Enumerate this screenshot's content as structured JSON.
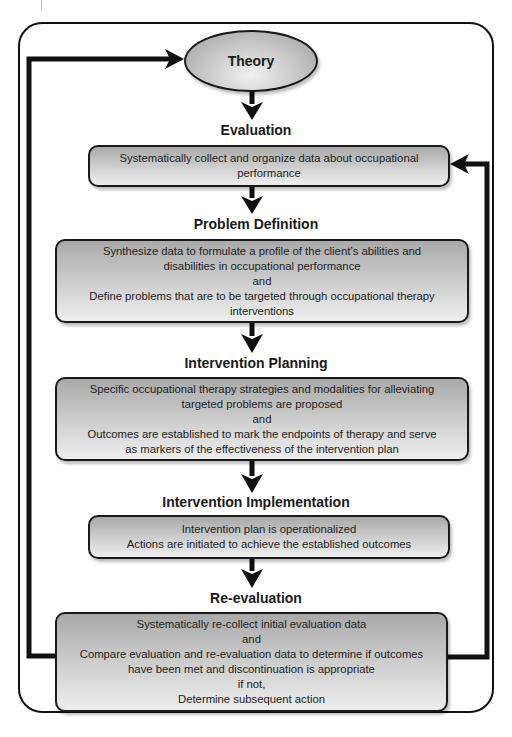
{
  "diagram": {
    "title_node": "Theory",
    "stages": [
      {
        "heading": "Evaluation",
        "lines": [
          "Systematically collect and organize data about occupational",
          "performance"
        ]
      },
      {
        "heading": "Problem Definition",
        "lines": [
          "Synthesize data to formulate a profile of the client’s abilities and",
          "disabilities in occupational performance",
          "and",
          "Define problems that are to be targeted through occupational therapy",
          "interventions"
        ]
      },
      {
        "heading": "Intervention Planning",
        "lines": [
          "Specific occupational therapy strategies and modalities for alleviating",
          "targeted problems are proposed",
          "and",
          "Outcomes are established to mark the endpoints of therapy and serve",
          "as markers of the effectiveness of the intervention plan"
        ]
      },
      {
        "heading": "Intervention Implementation",
        "lines": [
          "Intervention plan is operationalized",
          "Actions are initiated to achieve the established outcomes"
        ]
      },
      {
        "heading": "Re-evaluation",
        "lines": [
          "Systematically re-collect initial evaluation data",
          "and",
          "Compare evaluation and re-evaluation data to determine if outcomes",
          "have been met and discontinuation is appropriate",
          "if not,",
          "Determine subsequent action"
        ]
      }
    ],
    "feedback_loops": [
      {
        "from": "Re-evaluation",
        "to": "Theory",
        "side": "left"
      },
      {
        "from": "Re-evaluation",
        "to": "Evaluation",
        "side": "right"
      }
    ],
    "colors": {
      "stroke": "#111111",
      "box_gradient_top": "#a9a9a9",
      "box_gradient_bottom": "#eeeeee",
      "background": "#ffffff"
    }
  }
}
